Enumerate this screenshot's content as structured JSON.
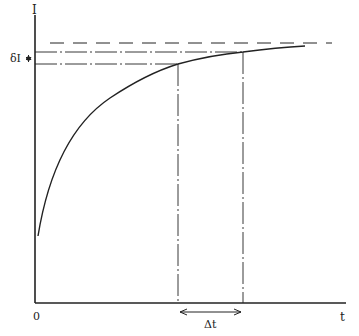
{
  "diagram": {
    "type": "saturation-curve",
    "axes": {
      "y_label": "I",
      "x_label": "t",
      "origin_label": "0"
    },
    "annotations": {
      "delta_I_label": "δI",
      "delta_t_label": "Δt"
    },
    "elements": [
      "Solid axes with origin at 0",
      "Concave rising curve approaching a horizontal dashed asymptote",
      "Two dash-dot horizontal lines from the I-axis to the curve",
      "Two dash-dot vertical lines from curve points down to the t-axis",
      "Double arrow on I-axis marking δI between the two horizontal lines",
      "Double arrow below t-axis marking Δt between the two vertical lines"
    ],
    "colors": {
      "ink": "#222222",
      "background": "#ffffff"
    }
  }
}
